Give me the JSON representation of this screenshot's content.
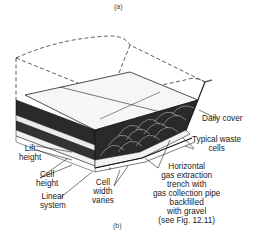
{
  "figure": {
    "caption_top": "(a)",
    "caption_bottom": "(b)"
  },
  "labels": {
    "daily_cover": "Daily cover",
    "waste_cells": [
      "Typical waste",
      "cells"
    ],
    "lift_height": [
      "Lift",
      "height"
    ],
    "cell_height": [
      "Cell",
      "height"
    ],
    "liner_system": [
      "Linear",
      "system"
    ],
    "cell_width": [
      "Cell",
      "width",
      "varies"
    ],
    "trench": [
      "Horizontal",
      "gas extraction",
      "trench with",
      "gas collection pipe",
      "backfilled",
      "with gravel",
      "(see Fig. 12.11)"
    ]
  },
  "colors": {
    "waste_fill": "#2a2a2a",
    "cover_fill": "#f4f4f4",
    "line": "#222222"
  }
}
